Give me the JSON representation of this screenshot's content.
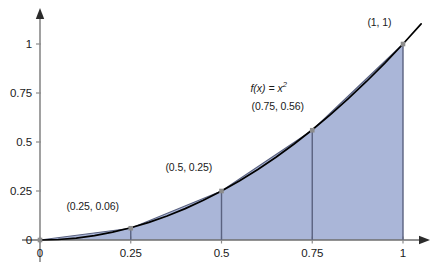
{
  "chart_data": {
    "type": "area",
    "title": "",
    "subtitle": "",
    "xlabel": "",
    "ylabel": "",
    "xlim": [
      0,
      1
    ],
    "ylim": [
      0,
      1
    ],
    "grid": false,
    "legend": false,
    "function_label": {
      "base": "f(x) = x",
      "exponent": "2",
      "full": "f(x) = x²",
      "x": 0.63,
      "y": 0.78
    },
    "curve": {
      "name": "f(x) = x²",
      "color": "#000000",
      "x": [
        0,
        0.05,
        0.1,
        0.15,
        0.2,
        0.25,
        0.3,
        0.35,
        0.4,
        0.45,
        0.5,
        0.55,
        0.6,
        0.65,
        0.7,
        0.75,
        0.8,
        0.85,
        0.9,
        0.95,
        1,
        1.05
      ],
      "y": [
        0,
        0.0025,
        0.01,
        0.0225,
        0.04,
        0.0625,
        0.09,
        0.1225,
        0.16,
        0.2025,
        0.25,
        0.3025,
        0.36,
        0.4225,
        0.49,
        0.5625,
        0.64,
        0.7225,
        0.81,
        0.9025,
        1,
        1.1025
      ]
    },
    "trapezoid_nodes": {
      "x": [
        0,
        0.25,
        0.5,
        0.75,
        1
      ],
      "y": [
        0,
        0.06,
        0.25,
        0.56,
        1
      ],
      "fill_color": "#aab6d8",
      "edge_color": "#5a6280"
    },
    "point_labels": [
      {
        "text": "(0.25, 0.06)",
        "x": 0.25,
        "y": 0.06,
        "label_x": 0.145,
        "label_y": 0.175
      },
      {
        "text": "(0.5, 0.25)",
        "x": 0.5,
        "y": 0.25,
        "label_x": 0.41,
        "label_y": 0.37
      },
      {
        "text": "(0.75, 0.56)",
        "x": 0.75,
        "y": 0.56,
        "label_x": 0.655,
        "label_y": 0.685
      },
      {
        "text": "(1, 1)",
        "x": 1,
        "y": 1,
        "label_x": 0.935,
        "label_y": 1.11
      }
    ],
    "x_ticks": [
      {
        "value": 0,
        "label": "0"
      },
      {
        "value": 0.25,
        "label": "0.25"
      },
      {
        "value": 0.5,
        "label": "0.5"
      },
      {
        "value": 0.75,
        "label": "0.75"
      },
      {
        "value": 1,
        "label": "1"
      }
    ],
    "y_ticks": [
      {
        "value": 0,
        "label": "0"
      },
      {
        "value": 0.25,
        "label": "0.25"
      },
      {
        "value": 0.5,
        "label": "0.5"
      },
      {
        "value": 0.75,
        "label": "0.75"
      },
      {
        "value": 1,
        "label": "1"
      }
    ],
    "axis_color": "#6e6e6e",
    "marker_color": "#8c8c8c",
    "background_color": "#ffffff"
  }
}
